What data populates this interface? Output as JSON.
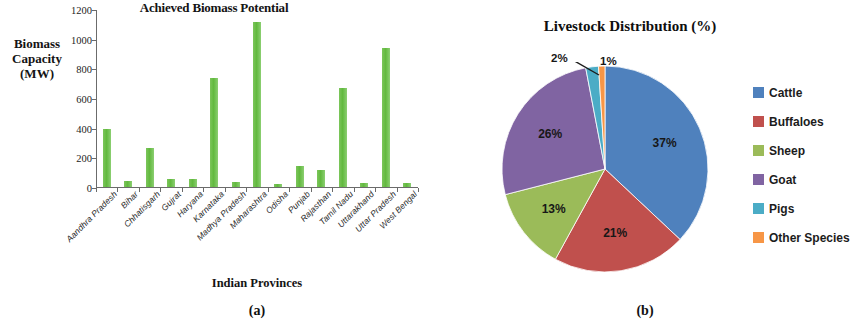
{
  "figure": {
    "panel_a_caption": "(a)",
    "panel_b_caption": "(b)"
  },
  "chart_data": [
    {
      "type": "bar",
      "title": "Achieved Biomass Potential",
      "xlabel": "Indian Provinces",
      "ylabel": "Biomass Capacity (MW)",
      "ylabel_lines": [
        "Biomass",
        "Capacity",
        "(MW)"
      ],
      "ylim": [
        0,
        1200
      ],
      "yticks": [
        0,
        200,
        400,
        600,
        800,
        1000,
        1200
      ],
      "ytick_labels": [
        "0",
        "200",
        "400",
        "600",
        "800",
        "1000",
        "1200"
      ],
      "grid": false,
      "legend": "none",
      "bar_color": "#66bb47",
      "categories": [
        "Aandhra Pradesh",
        "Bihar",
        "Chhatisgarh",
        "Gujrat",
        "Haryana",
        "Karnataka",
        "Madhya Pradesh",
        "Maharashtra",
        "Odisha",
        "Punjab",
        "Rajasthan",
        "Tamil Nadu",
        "Uttarakhand",
        "Uttar Pradesh",
        "West Bengal"
      ],
      "values": [
        390,
        40,
        262,
        52,
        52,
        738,
        35,
        1112,
        20,
        140,
        115,
        665,
        30,
        938,
        28
      ]
    },
    {
      "type": "pie",
      "title": "Livestock Distribution (%)",
      "legend_position": "right",
      "labels": [
        "Cattle",
        "Buffaloes",
        "Sheep",
        "Goat",
        "Pigs",
        "Other Species"
      ],
      "values": [
        37,
        21,
        13,
        26,
        2,
        1
      ],
      "value_labels": [
        "37%",
        "21%",
        "13%",
        "26%",
        "2%",
        "1%"
      ],
      "colors": [
        "#4f81bd",
        "#c0504d",
        "#9bbb59",
        "#8064a2",
        "#4bacc6",
        "#f79646"
      ]
    }
  ]
}
